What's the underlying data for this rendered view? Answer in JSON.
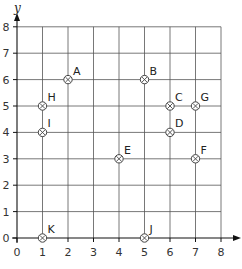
{
  "chart_data": {
    "type": "scatter",
    "title": "",
    "xlabel": "",
    "ylabel": "y",
    "xlim": [
      0,
      8
    ],
    "ylim": [
      0,
      8
    ],
    "grid": true,
    "x_ticks": [
      "0",
      "1",
      "2",
      "3",
      "4",
      "5",
      "6",
      "7",
      "8"
    ],
    "y_ticks": [
      "0",
      "1",
      "2",
      "3",
      "4",
      "5",
      "6",
      "7",
      "8"
    ],
    "points": [
      {
        "label": "A",
        "x": 2,
        "y": 6
      },
      {
        "label": "B",
        "x": 5,
        "y": 6
      },
      {
        "label": "C",
        "x": 6,
        "y": 5
      },
      {
        "label": "D",
        "x": 6,
        "y": 4
      },
      {
        "label": "E",
        "x": 4,
        "y": 3
      },
      {
        "label": "F",
        "x": 7,
        "y": 3
      },
      {
        "label": "G",
        "x": 7,
        "y": 5
      },
      {
        "label": "H",
        "x": 1,
        "y": 5
      },
      {
        "label": "I",
        "x": 1,
        "y": 4
      },
      {
        "label": "J",
        "x": 5,
        "y": 0
      },
      {
        "label": "K",
        "x": 1,
        "y": 0
      }
    ],
    "colors": {
      "grid": "#555555",
      "axis": "#111111",
      "marker": "#444444"
    }
  }
}
